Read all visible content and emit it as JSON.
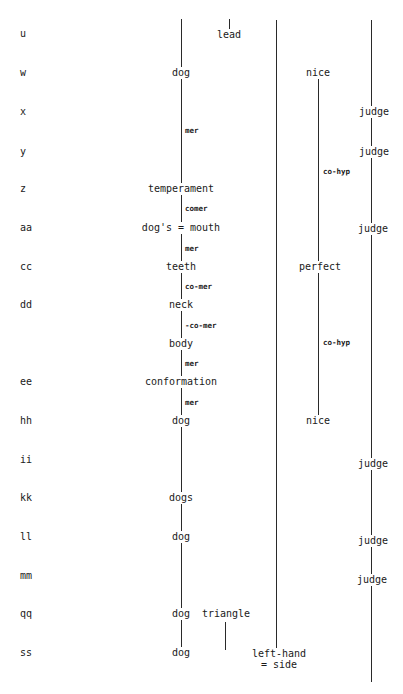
{
  "rows": [
    "u",
    "w",
    "x",
    "y",
    "z",
    "aa",
    "cc",
    "dd",
    "ee",
    "hh",
    "ii",
    "kk",
    "ll",
    "mm",
    "qq",
    "ss"
  ],
  "column1": {
    "nodes": [
      "dog",
      "temperament",
      "dog's = mouth",
      "teeth",
      "neck",
      "body",
      "conformation",
      "dog",
      "dogs",
      "dog",
      "dog",
      "dog"
    ],
    "relations": [
      "mer",
      "comer",
      "mer",
      "co-mer",
      "-co-mer",
      "mer",
      "mer"
    ]
  },
  "column2": {
    "nodes": [
      "lead",
      "triangle"
    ]
  },
  "column3": {
    "nodes": [
      "left-hand",
      "= side"
    ]
  },
  "column4": {
    "nodes": [
      "nice",
      "perfect",
      "nice"
    ],
    "relations": [
      "co-hyp",
      "co-hyp"
    ]
  },
  "column5": {
    "nodes": [
      "judge",
      "judge",
      "judge",
      "judge",
      "judge",
      "judge"
    ]
  }
}
